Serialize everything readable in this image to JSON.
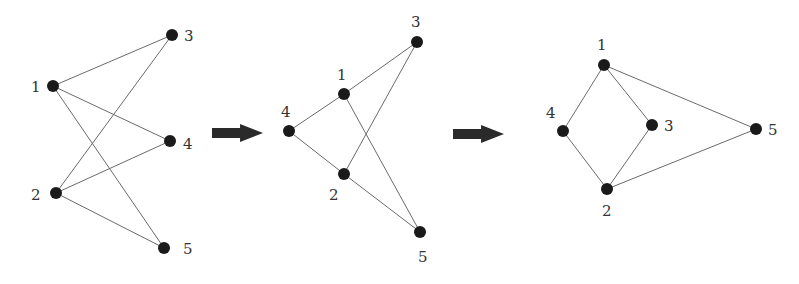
{
  "edges": [
    [
      1,
      3
    ],
    [
      1,
      4
    ],
    [
      1,
      5
    ],
    [
      2,
      3
    ],
    [
      2,
      4
    ],
    [
      2,
      5
    ]
  ],
  "graphs": [
    {
      "name": "bipartite-layout",
      "nodes": [
        {
          "id": "1",
          "x": 53,
          "y": 86,
          "lx": 31,
          "ly": 92
        },
        {
          "id": "2",
          "x": 56,
          "y": 193,
          "lx": 31,
          "ly": 200
        },
        {
          "id": "3",
          "x": 172,
          "y": 35,
          "lx": 184,
          "ly": 41
        },
        {
          "id": "4",
          "x": 170,
          "y": 141,
          "lx": 183,
          "ly": 149
        },
        {
          "id": "5",
          "x": 164,
          "y": 248,
          "lx": 183,
          "ly": 254
        }
      ]
    },
    {
      "name": "intermediate-layout",
      "nodes": [
        {
          "id": "1",
          "x": 344,
          "y": 94,
          "lx": 337,
          "ly": 80
        },
        {
          "id": "2",
          "x": 344,
          "y": 174,
          "lx": 329,
          "ly": 200
        },
        {
          "id": "3",
          "x": 417,
          "y": 42,
          "lx": 411,
          "ly": 27
        },
        {
          "id": "4",
          "x": 289,
          "y": 131,
          "lx": 281,
          "ly": 117
        },
        {
          "id": "5",
          "x": 420,
          "y": 232,
          "lx": 418,
          "ly": 262
        }
      ]
    },
    {
      "name": "planar-layout",
      "nodes": [
        {
          "id": "1",
          "x": 604,
          "y": 65,
          "lx": 597,
          "ly": 50
        },
        {
          "id": "2",
          "x": 607,
          "y": 189,
          "lx": 602,
          "ly": 216
        },
        {
          "id": "3",
          "x": 652,
          "y": 125,
          "lx": 664,
          "ly": 131
        },
        {
          "id": "4",
          "x": 563,
          "y": 131,
          "lx": 546,
          "ly": 118
        },
        {
          "id": "5",
          "x": 756,
          "y": 129,
          "lx": 768,
          "ly": 135
        }
      ]
    }
  ],
  "arrows": [
    {
      "x": 212,
      "y": 133,
      "w": 51
    },
    {
      "x": 453,
      "y": 134,
      "w": 51
    }
  ]
}
